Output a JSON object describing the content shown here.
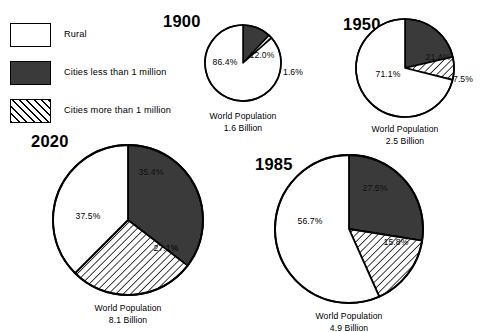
{
  "figure": {
    "background_color": "#ffffff",
    "ink_color": "#000000",
    "dark_fill": "#3a3a3a",
    "light_fill": "#ffffff"
  },
  "legend": {
    "items": [
      {
        "key": "rural",
        "label": "Rural",
        "pattern": "solid-white"
      },
      {
        "key": "cities_less_1m",
        "label": "Cities less than 1 million",
        "pattern": "solid-dark"
      },
      {
        "key": "cities_more_1m",
        "label": "Cities more than 1 million",
        "pattern": "hatched"
      }
    ]
  },
  "charts": [
    {
      "id": "chart-1900",
      "year": "1900",
      "caption_line1": "World Population",
      "caption_line2": "1.6 Billion",
      "population_billion": 1.6,
      "slices": [
        {
          "key": "cities_less_1m",
          "label": "12.0%",
          "value": 12.0,
          "pattern": "solid-dark"
        },
        {
          "key": "cities_more_1m",
          "label": "1.6%",
          "value": 1.6,
          "pattern": "hatched"
        },
        {
          "key": "rural",
          "label": "86.4%",
          "value": 86.4,
          "pattern": "solid-white"
        }
      ]
    },
    {
      "id": "chart-1950",
      "year": "1950",
      "caption_line1": "World Population",
      "caption_line2": "2.5 Billion",
      "population_billion": 2.5,
      "slices": [
        {
          "key": "cities_less_1m",
          "label": "21.4%",
          "value": 21.4,
          "pattern": "solid-dark"
        },
        {
          "key": "cities_more_1m",
          "label": "7.5%",
          "value": 7.5,
          "pattern": "hatched"
        },
        {
          "key": "rural",
          "label": "71.1%",
          "value": 71.1,
          "pattern": "solid-white"
        }
      ]
    },
    {
      "id": "chart-1985",
      "year": "1985",
      "caption_line1": "World Population",
      "caption_line2": "4.9 Billion",
      "population_billion": 4.9,
      "slices": [
        {
          "key": "cities_less_1m",
          "label": "27.5%",
          "value": 27.5,
          "pattern": "solid-dark"
        },
        {
          "key": "cities_more_1m",
          "label": "15.8%",
          "value": 15.8,
          "pattern": "hatched"
        },
        {
          "key": "rural",
          "label": "56.7%",
          "value": 56.7,
          "pattern": "solid-white"
        }
      ]
    },
    {
      "id": "chart-2020",
      "year": "2020",
      "caption_line1": "World Population",
      "caption_line2": "8.1 Billion",
      "population_billion": 8.1,
      "slices": [
        {
          "key": "cities_less_1m",
          "label": "35.4%",
          "value": 35.4,
          "pattern": "solid-dark"
        },
        {
          "key": "cities_more_1m",
          "label": "27.1%",
          "value": 27.1,
          "pattern": "hatched"
        },
        {
          "key": "rural",
          "label": "37.5%",
          "value": 37.5,
          "pattern": "solid-white"
        }
      ]
    }
  ],
  "chart_data": {
    "type": "pie",
    "categories": [
      "Rural",
      "Cities less than 1 million",
      "Cities more than 1 million"
    ],
    "legend_position": "top-left",
    "grid": false,
    "units": "percent",
    "panels": [
      {
        "name": "1900",
        "world_population_billion": 1.6,
        "world_population_label": "1.6 Billion",
        "values": [
          86.4,
          12.0,
          1.6
        ],
        "labels": [
          "86.4%",
          "12.0%",
          "1.6%"
        ]
      },
      {
        "name": "1950",
        "world_population_billion": 2.5,
        "world_population_label": "2.5 Billion",
        "values": [
          71.1,
          21.4,
          7.5
        ],
        "labels": [
          "71.1%",
          "21.4%",
          "7.5%"
        ]
      },
      {
        "name": "1985",
        "world_population_billion": 4.9,
        "world_population_label": "4.9 Billion",
        "values": [
          56.7,
          27.5,
          15.8
        ],
        "labels": [
          "56.7%",
          "27.5%",
          "15.8%"
        ]
      },
      {
        "name": "2020",
        "world_population_billion": 8.1,
        "world_population_label": "8.1 Billion",
        "values": [
          37.5,
          35.4,
          27.1
        ],
        "labels": [
          "37.5%",
          "35.4%",
          "27.1%"
        ]
      }
    ]
  }
}
